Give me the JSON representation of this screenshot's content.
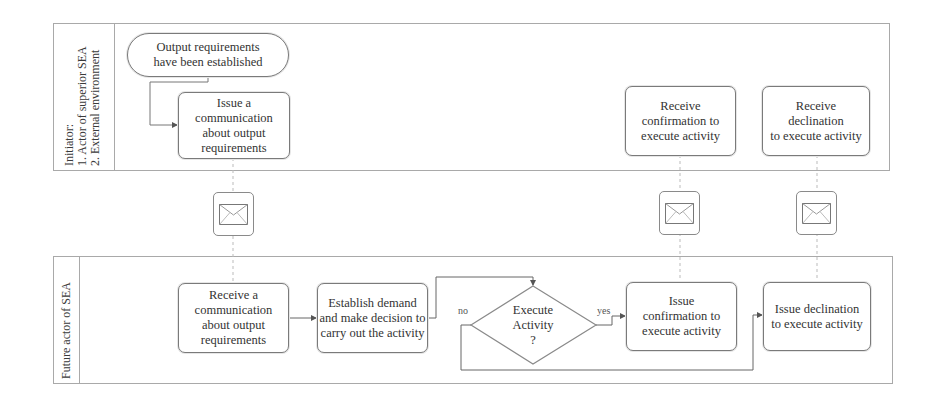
{
  "lanes": {
    "initiator": {
      "label_lines": [
        "Initiator:",
        "1. Actor of superior SEA",
        "2. External environment"
      ]
    },
    "future_actor": {
      "label": "Future actor of SEA"
    }
  },
  "nodes": {
    "start": {
      "lines": [
        "Output requirements",
        "have been established"
      ]
    },
    "issue_communication": {
      "lines": [
        "Issue a",
        "communication",
        "about output",
        "requirements"
      ]
    },
    "receive_confirmation": {
      "lines": [
        "Receive",
        "confirmation to",
        "execute activity"
      ]
    },
    "receive_declination": {
      "lines": [
        "Receive declination",
        "to execute activity"
      ]
    },
    "receive_communication": {
      "lines": [
        "Receive a",
        "communication",
        "about output",
        "requirements"
      ]
    },
    "establish_demand": {
      "lines": [
        "Establish demand",
        "and make decision to",
        "carry out the activity"
      ]
    },
    "decision": {
      "lines": [
        "Execute",
        "Activity",
        "?"
      ]
    },
    "issue_confirmation": {
      "lines": [
        "Issue",
        "confirmation to",
        "execute activity"
      ]
    },
    "issue_declination": {
      "lines": [
        "Issue declination",
        "to execute activity"
      ]
    }
  },
  "edge_labels": {
    "no": "no",
    "yes": "yes"
  },
  "message_icons": [
    "envelope-icon",
    "envelope-icon",
    "envelope-icon"
  ],
  "colors": {
    "line": "#7a7a7a",
    "lane_border": "#a9a9a9",
    "text": "#333333",
    "background": "#ffffff"
  }
}
